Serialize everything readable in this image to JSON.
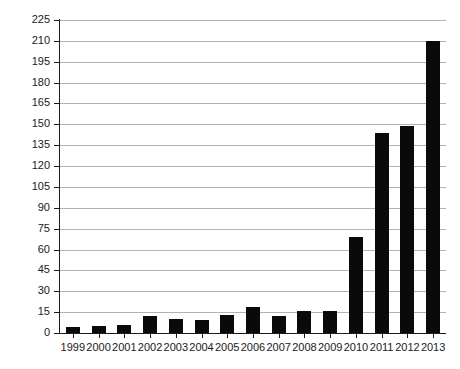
{
  "chart_data": {
    "type": "bar",
    "title": "",
    "subtitle": "",
    "xlabel": "",
    "ylabel": "",
    "categories": [
      "1999",
      "2000",
      "2001",
      "2002",
      "2003",
      "2004",
      "2005",
      "2006",
      "2007",
      "2008",
      "2009",
      "2010",
      "2011",
      "2012",
      "2013"
    ],
    "values": [
      4,
      5,
      6,
      12,
      10,
      9,
      13,
      19,
      12,
      16,
      16,
      69,
      144,
      149,
      210
    ],
    "series": [
      {
        "name": "",
        "values": [
          4,
          5,
          6,
          12,
          10,
          9,
          13,
          19,
          12,
          16,
          16,
          69,
          144,
          149,
          210
        ]
      }
    ],
    "ylim": [
      0,
      225
    ],
    "ytick_step": 15,
    "yticks": [
      0,
      15,
      30,
      45,
      60,
      75,
      90,
      105,
      120,
      135,
      150,
      165,
      180,
      195,
      210,
      225
    ],
    "ytick_labels": [
      "0",
      "15",
      "30",
      "45",
      "60",
      "75",
      "90",
      "105",
      "120",
      "135",
      "150",
      "165",
      "180",
      "195",
      "210",
      "225"
    ],
    "grid": true,
    "grid_axis": "y",
    "legend": false,
    "legend_position": "none",
    "bar_color": "#0a0a0a",
    "grid_color": "#b3b3b3",
    "axis_color": "#1a1a1a",
    "background_color": "#ffffff",
    "annotations": []
  }
}
